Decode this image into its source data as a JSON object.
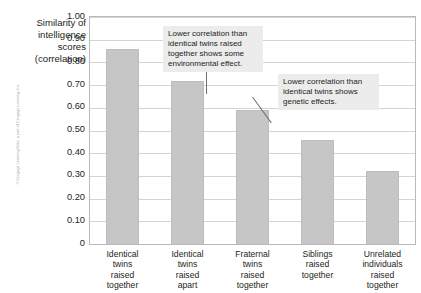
{
  "credit": {
    "text": "© Cengage Learning/Gale, a part of Cengage Learning, Inc."
  },
  "chart_data": {
    "type": "bar",
    "title": "",
    "xlabel": "",
    "ylabel": "Similarity of intelligence scores (correlation)",
    "ylim": [
      0,
      1.0
    ],
    "grid": true,
    "legend": "none",
    "categories": [
      "Identical twins raised together",
      "Identical twins raised apart",
      "Fraternal twins raised together",
      "Siblings raised together",
      "Unrelated individuals raised together"
    ],
    "category_lines": [
      [
        "Identical",
        "twins",
        "raised",
        "together"
      ],
      [
        "Identical",
        "twins",
        "raised",
        "apart"
      ],
      [
        "Fraternal",
        "twins",
        "raised",
        "together"
      ],
      [
        "Siblings",
        "raised",
        "together"
      ],
      [
        "Unrelated",
        "individuals",
        "raised",
        "together"
      ]
    ],
    "values": [
      0.86,
      0.72,
      0.59,
      0.46,
      0.32
    ],
    "ytick_labels": [
      "1.00",
      "0.90",
      "0.80",
      "0.70",
      "0.60",
      "0.50",
      "0.40",
      "0.30",
      "0.20",
      "0.10",
      "0"
    ],
    "ytick_values": [
      1.0,
      0.9,
      0.8,
      0.7,
      0.6,
      0.5,
      0.4,
      0.3,
      0.2,
      0.1,
      0
    ],
    "bar_color": "#c6c6c6",
    "grid_color": "#d4d4d4",
    "frame_color": "#b9b9b9",
    "annotations": [
      {
        "id": "environmental-effect",
        "text": "Lower correlation than identical twins raised together shows some environmental effect.",
        "target_category": "Identical twins raised apart"
      },
      {
        "id": "genetic-effect",
        "text": "Lower correlation than identical twins shows genetic effects.",
        "target_category": "Fraternal twins raised together"
      }
    ]
  }
}
